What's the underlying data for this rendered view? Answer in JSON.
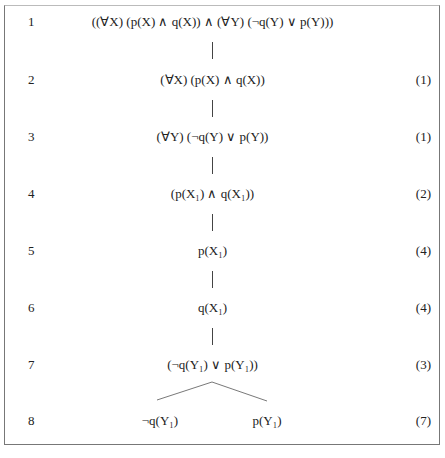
{
  "tableau": {
    "rows": [
      {
        "num": "1",
        "formula": "((∀X) (p(X) ∧ q(X)) ∧ (∀Y) (¬q(Y) ∨ p(Y)))",
        "ref": ""
      },
      {
        "num": "2",
        "formula": "(∀X) (p(X) ∧ q(X))",
        "ref": "(1)"
      },
      {
        "num": "3",
        "formula": "(∀Y) (¬q(Y) ∨ p(Y))",
        "ref": "(1)"
      },
      {
        "num": "4",
        "formula": "(p(X₁) ∧ q(X₁))",
        "ref": "(2)"
      },
      {
        "num": "5",
        "formula": "p(X₁)",
        "ref": "(4)"
      },
      {
        "num": "6",
        "formula": "q(X₁)",
        "ref": "(4)"
      },
      {
        "num": "7",
        "formula": "(¬q(Y₁) ∨ p(Y₁))",
        "ref": "(3)"
      },
      {
        "num": "8",
        "branches": [
          "¬q(Y₁)",
          "p(Y₁)"
        ],
        "ref": "(7)"
      }
    ]
  }
}
